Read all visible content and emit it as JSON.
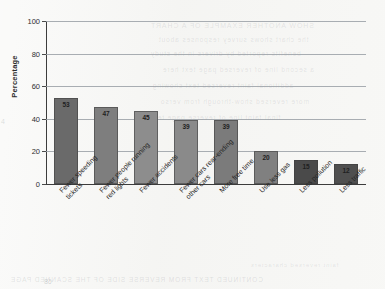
{
  "chart_data": {
    "type": "bar",
    "title": "",
    "subtitle": "",
    "xlabel": "",
    "ylabel": "Percentage",
    "ylim": [
      0,
      100
    ],
    "yticks": [
      0,
      20,
      40,
      60,
      80,
      100
    ],
    "grid": true,
    "legend": "none",
    "categories": [
      "Fewer speeding tickets",
      "Fewer people running red lights",
      "Fewer accidents",
      "Fewer cars rear-ending other cars",
      "More free time",
      "Use less gas",
      "Less pollution",
      "Less traffic"
    ],
    "category_lines": [
      [
        "Fewer speeding",
        "tickets"
      ],
      [
        "Fewer people running",
        "red lights"
      ],
      [
        "Fewer accidents"
      ],
      [
        "Fewer cars rear-ending",
        "other cars"
      ],
      [
        "More free time"
      ],
      [
        "Use less gas"
      ],
      [
        "Less pollution"
      ],
      [
        "Less traffic"
      ]
    ],
    "values": [
      53,
      47,
      45,
      39,
      39,
      20,
      15,
      12
    ],
    "value_labels": [
      "53",
      "47",
      "45",
      "39",
      "39",
      "20",
      "15",
      "12"
    ],
    "bar_colors": [
      "#6a6a6a",
      "#7e7e7e",
      "#8d8d8d",
      "#8a8a8a",
      "#7b7b7b",
      "#808080",
      "#4a4a4a",
      "#4f4f4f"
    ]
  },
  "axis": {
    "y_tick_labels": [
      "100",
      "80",
      "60",
      "40",
      "20",
      "0"
    ],
    "y_axis_title": "Percentage"
  },
  "artifacts": {
    "bleed_lines": [
      "SHOW ANOTHER EXAMPLE OF A CHART",
      "the chart shows survey responses about",
      "benefits reported by drivers in the study",
      "a second line of reversed page text here",
      "additional faint reversed text showing",
      "more reversed show-through from verso",
      "final faint line of reverse page text",
      "CONTINUED TEXT FROM REVERSE SIDE OF THE SCANNED PAGE",
      "faint reversed characters"
    ],
    "edge_mark": "4",
    "page_number": "68"
  }
}
